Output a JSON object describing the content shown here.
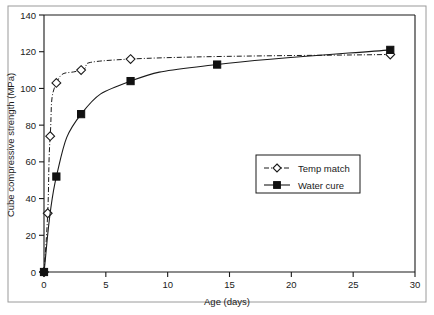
{
  "chart_data": {
    "type": "line",
    "title": "",
    "xlabel": "Age (days)",
    "ylabel": "Cube compressive strength (MPa)",
    "xlim": [
      0,
      30
    ],
    "ylim": [
      0,
      140
    ],
    "xticks": [
      0,
      5,
      10,
      15,
      20,
      25,
      30
    ],
    "yticks": [
      0,
      20,
      40,
      60,
      80,
      100,
      120,
      140
    ],
    "grid": false,
    "legend_position": "lower-right-center",
    "series": [
      {
        "name": "Temp match",
        "marker": "open-diamond",
        "linestyle": "dash-dot",
        "color": "#1a1a1a",
        "points": [
          {
            "x": 0,
            "y": 0
          },
          {
            "x": 0.3,
            "y": 32
          },
          {
            "x": 0.5,
            "y": 74
          },
          {
            "x": 1,
            "y": 103
          },
          {
            "x": 3,
            "y": 110
          },
          {
            "x": 7,
            "y": 116
          },
          {
            "x": 28,
            "y": 118.5
          }
        ]
      },
      {
        "name": "Water cure",
        "marker": "filled-square",
        "linestyle": "solid",
        "color": "#111111",
        "points": [
          {
            "x": 0,
            "y": 0
          },
          {
            "x": 1,
            "y": 52
          },
          {
            "x": 3,
            "y": 86
          },
          {
            "x": 7,
            "y": 104
          },
          {
            "x": 14,
            "y": 113
          },
          {
            "x": 28,
            "y": 121
          }
        ]
      }
    ]
  },
  "legend": {
    "entries": [
      {
        "label": "Temp match"
      },
      {
        "label": "Water cure"
      }
    ]
  },
  "axes": {
    "x_title": "Age (days)",
    "y_title": "Cube compressive strength (MPa)",
    "x_tick_labels": [
      "0",
      "5",
      "10",
      "15",
      "20",
      "25",
      "30"
    ],
    "y_tick_labels": [
      "0",
      "20",
      "40",
      "60",
      "80",
      "100",
      "120",
      "140"
    ]
  },
  "colors": {
    "axis": "#1a1a1a",
    "frame": "#9a9a9a",
    "background": "#ffffff"
  }
}
